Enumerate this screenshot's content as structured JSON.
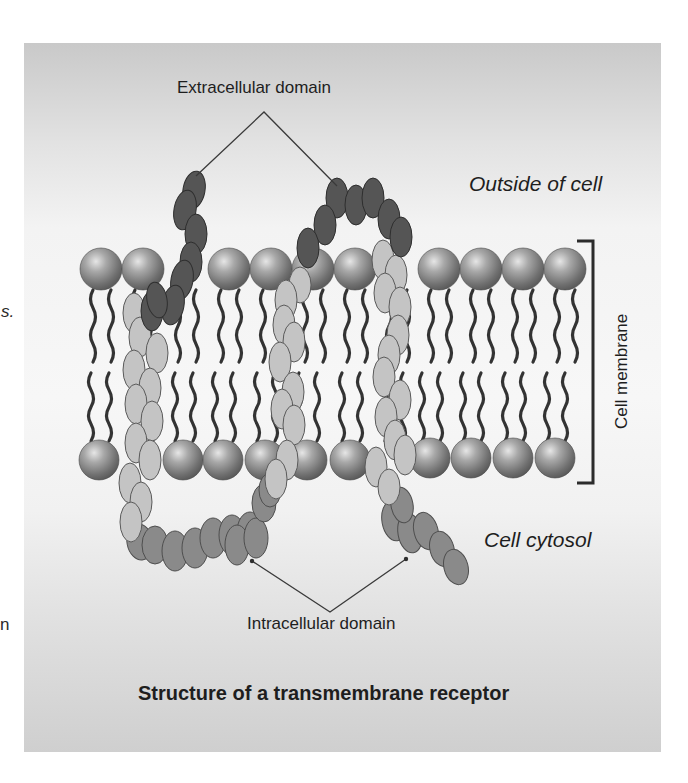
{
  "edge_fragments": {
    "left_upper": "s.",
    "left_lower": "n"
  },
  "figure": {
    "title": "Structure of a transmembrane receptor",
    "labels": {
      "extracellular": "Extracellular domain",
      "intracellular": "Intracellular domain",
      "outside": "Outside of cell",
      "cytosol": "Cell cytosol",
      "membrane": "Cell membrane"
    },
    "colors": {
      "panel_top": "#c9c9c9",
      "panel_mid": "#f7f7f7",
      "extracellular_domain": "#555555",
      "transmembrane_helix": "#c4c4c4",
      "intracellular_domain": "#8a8a8a",
      "phospholipid_head": "#9a9a9a",
      "lipid_tail": "#333333",
      "leader_line": "#3a3a3a"
    },
    "membrane": {
      "top_head_row_x": [
        101,
        143,
        229,
        271,
        313,
        355,
        439,
        481,
        523,
        565
      ],
      "bottom_head_row_x": [
        99,
        183,
        223,
        265,
        307,
        350,
        430,
        471,
        513,
        555
      ]
    }
  }
}
